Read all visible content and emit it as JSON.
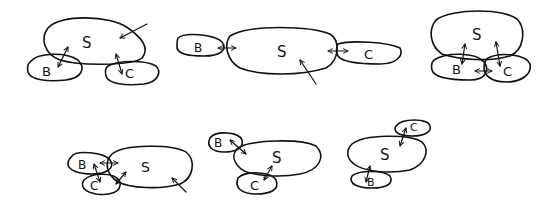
{
  "labels": {
    "s": "S",
    "b": "B",
    "c": "C"
  },
  "panels": [
    {
      "id": 1,
      "arrangement": "S top, B bottom-left, C bottom-right, external arrow into S from top-right"
    },
    {
      "id": 2,
      "arrangement": "B left, S center, C right in a row, external arrow into S from bottom"
    },
    {
      "id": 3,
      "arrangement": "S top, B and C overlapping below, double arrows S-B, S-C, B-C"
    },
    {
      "id": 4,
      "arrangement": "B and C stacked left of S, double arrows B-S, C-S, B-C, external arrow into S from bottom-right"
    },
    {
      "id": 5,
      "arrangement": "B top-left, S center, C bottom, double arrows B-S and C-S"
    },
    {
      "id": 6,
      "arrangement": "C top-right, S center, B bottom-left, double arrows C-S and B-S"
    }
  ]
}
